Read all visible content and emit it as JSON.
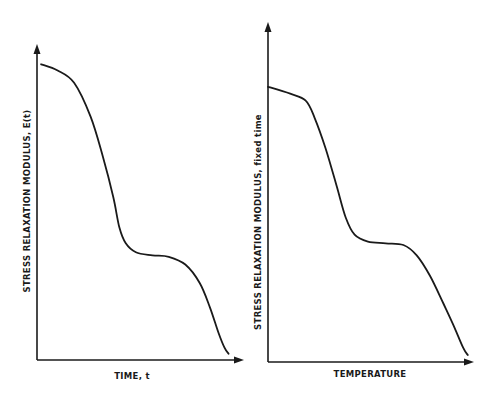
{
  "chart_data": [
    {
      "type": "line",
      "title": "",
      "xlabel": "TIME, t",
      "ylabel": "STRESS RELAXATION MODULUS, E(t)",
      "xlim": [
        0,
        1
      ],
      "ylim": [
        0,
        1
      ],
      "grid": false,
      "ticks": "none",
      "series": [
        {
          "name": "E(t)",
          "x": [
            0.02,
            0.1,
            0.18,
            0.26,
            0.32,
            0.37,
            0.4,
            0.43,
            0.48,
            0.56,
            0.64,
            0.72,
            0.79,
            0.84,
            0.88,
            0.91,
            0.93
          ],
          "y": [
            0.96,
            0.94,
            0.9,
            0.79,
            0.66,
            0.53,
            0.43,
            0.38,
            0.35,
            0.34,
            0.335,
            0.31,
            0.25,
            0.17,
            0.09,
            0.04,
            0.02
          ]
        }
      ]
    },
    {
      "type": "line",
      "title": "",
      "xlabel": "TEMPERATURE",
      "ylabel": "STRESS RELAXATION MODULUS, fixed time",
      "xlim": [
        0,
        1
      ],
      "ylim": [
        0,
        1
      ],
      "grid": false,
      "ticks": "none",
      "series": [
        {
          "name": "E(T), fixed time",
          "x": [
            0.0,
            0.1,
            0.17,
            0.21,
            0.26,
            0.31,
            0.35,
            0.39,
            0.45,
            0.53,
            0.61,
            0.67,
            0.73,
            0.79,
            0.84,
            0.88,
            0.9
          ],
          "y": [
            0.8,
            0.78,
            0.76,
            0.71,
            0.62,
            0.51,
            0.42,
            0.37,
            0.35,
            0.345,
            0.34,
            0.31,
            0.25,
            0.17,
            0.1,
            0.04,
            0.02
          ]
        }
      ]
    }
  ]
}
